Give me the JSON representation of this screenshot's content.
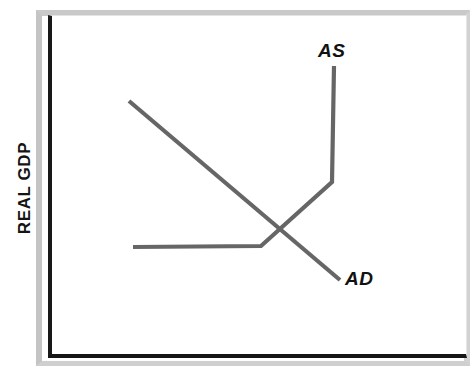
{
  "figure": {
    "kind": "economics-line-diagram",
    "y_axis_title": "REAL GDP",
    "x_axis_title": "",
    "background_color": "#ffffff",
    "frame_color": "#181818",
    "mount_color": "#c9c9c9",
    "curve_color": "#666666",
    "label_color": "#111111"
  },
  "labels": {
    "as": "AS",
    "ad": "AD"
  },
  "chart_data": {
    "type": "line",
    "title": "",
    "xlabel": "",
    "ylabel": "REAL GDP",
    "grid": false,
    "legend": "inline-curve-labels",
    "axis_ticks": [],
    "xlim": [
      0,
      100
    ],
    "ylim": [
      0,
      100
    ],
    "series": [
      {
        "name": "AS",
        "label": "AS",
        "color": "#666666",
        "shape": "piecewise-kinked-upward",
        "description": "Aggregate supply: flat at low output, upward sloping through intermediate range, then vertical at full capacity",
        "points_px": [
          [
            133,
            247
          ],
          [
            261,
            246
          ],
          [
            332,
            182
          ],
          [
            334,
            66
          ]
        ],
        "segments": [
          {
            "name": "keynesian-horizontal-range",
            "from_px": [
              133,
              247
            ],
            "to_px": [
              261,
              246
            ]
          },
          {
            "name": "intermediate-upward-range",
            "from_px": [
              261,
              246
            ],
            "to_px": [
              332,
              182
            ]
          },
          {
            "name": "classical-vertical-range",
            "from_px": [
              332,
              182
            ],
            "to_px": [
              334,
              66
            ]
          }
        ],
        "label_position_px": [
          318,
          40
        ]
      },
      {
        "name": "AD",
        "label": "AD",
        "color": "#666666",
        "shape": "straight-downward-sloping",
        "description": "Aggregate demand: single straight line sloping down from upper-left to lower-right",
        "points_px": [
          [
            129,
            101
          ],
          [
            340,
            280
          ]
        ],
        "segments": [
          {
            "name": "aggregate-demand-line",
            "from_px": [
              129,
              101
            ],
            "to_px": [
              340,
              280
            ]
          }
        ],
        "label_position_px": [
          345,
          268
        ]
      }
    ],
    "annotations": [
      {
        "name": "equilibrium-intersection",
        "text": "",
        "point_px": [
          281,
          223
        ],
        "description": "AD crosses AS in the upward-sloping intermediate range"
      }
    ]
  }
}
